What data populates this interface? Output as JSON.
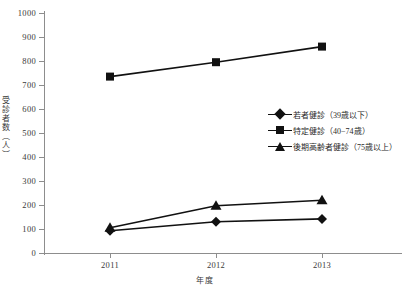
{
  "chart_data": {
    "type": "line",
    "title": "",
    "xlabel": "年度",
    "ylabel": "受診者数（人）",
    "categories": [
      "2011",
      "2012",
      "2013"
    ],
    "ylim": [
      0,
      1000
    ],
    "ytick_step": 100,
    "yticks": [
      "1000",
      "900",
      "800",
      "700",
      "600",
      "500",
      "400",
      "300",
      "200",
      "100",
      "0"
    ],
    "grid": false,
    "legend_position": "center-right",
    "series": [
      {
        "name": "若者健診（39歳以下）",
        "marker": "diamond",
        "color": "#111111",
        "values": [
          93,
          130,
          142
        ]
      },
      {
        "name": "特定健診（40−74歳）",
        "marker": "square",
        "color": "#111111",
        "values": [
          735,
          795,
          860
        ]
      },
      {
        "name": "後期高齢者健診（75歳以上）",
        "marker": "triangle",
        "color": "#111111",
        "values": [
          105,
          197,
          220
        ]
      }
    ]
  },
  "axis": {
    "y_title": "受診者数（人）",
    "x_title": "年度"
  },
  "legend": {
    "items": [
      {
        "label": "若者健診（39歳以下）",
        "marker": "diamond"
      },
      {
        "label": "特定健診（40−74歳）",
        "marker": "square"
      },
      {
        "label": "後期高齢者健診（75歳以上）",
        "marker": "triangle"
      }
    ]
  }
}
